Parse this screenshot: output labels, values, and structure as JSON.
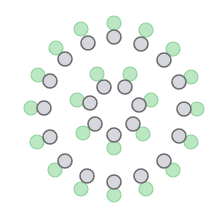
{
  "diagram": {
    "width": 221,
    "height": 215,
    "center": [
      114,
      109
    ],
    "node_radius": 7,
    "colors": {
      "background": "#ffffff",
      "green_fill": "#b4e6bd",
      "green_stroke": "#8ed39b",
      "grey_fill": "#d3d5da",
      "grey_stroke": "#6b6b6e"
    },
    "outer_ring": [
      {
        "grey": [
          114,
          37
        ],
        "green": [
          114,
          23
        ]
      },
      {
        "grey": [
          141,
          44
        ],
        "green": [
          146,
          30
        ]
      },
      {
        "grey": [
          164,
          60
        ],
        "green": [
          173,
          49
        ]
      },
      {
        "grey": [
          179,
          82
        ],
        "green": [
          191,
          77
        ]
      },
      {
        "grey": [
          184,
          109
        ],
        "green": [
          197,
          109
        ]
      },
      {
        "grey": [
          179,
          136
        ],
        "green": [
          191,
          142
        ]
      },
      {
        "grey": [
          164,
          161
        ],
        "green": [
          173,
          170
        ]
      },
      {
        "grey": [
          141,
          176
        ],
        "green": [
          146,
          189
        ]
      },
      {
        "grey": [
          114,
          182
        ],
        "green": [
          114,
          195
        ]
      },
      {
        "grey": [
          87,
          176
        ],
        "green": [
          81,
          189
        ]
      },
      {
        "grey": [
          65,
          161
        ],
        "green": [
          55,
          170
        ]
      },
      {
        "grey": [
          50,
          137
        ],
        "green": [
          37,
          142
        ]
      },
      {
        "grey": [
          44,
          108
        ],
        "green": [
          31,
          108
        ]
      },
      {
        "grey": [
          50,
          81
        ],
        "green": [
          38,
          75
        ]
      },
      {
        "grey": [
          65,
          59
        ],
        "green": [
          56,
          48
        ]
      },
      {
        "grey": [
          88,
          43
        ],
        "green": [
          81,
          29
        ]
      }
    ],
    "inner_ring": [
      {
        "grey": [
          104,
          87
        ],
        "green": [
          97,
          74
        ]
      },
      {
        "grey": [
          125,
          87
        ],
        "green": [
          130,
          74
        ]
      },
      {
        "grey": [
          139,
          105
        ],
        "green": [
          151,
          100
        ]
      },
      {
        "grey": [
          133,
          124
        ],
        "green": [
          143,
          134
        ]
      },
      {
        "grey": [
          114,
          135
        ],
        "green": [
          114,
          148
        ]
      },
      {
        "grey": [
          95,
          124
        ],
        "green": [
          83,
          133
        ]
      },
      {
        "grey": [
          90,
          103
        ],
        "green": [
          77,
          100
        ]
      }
    ]
  }
}
